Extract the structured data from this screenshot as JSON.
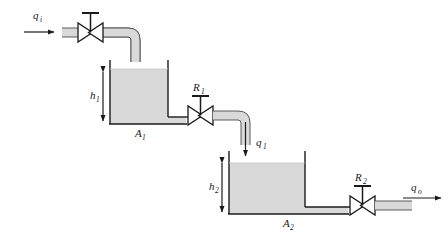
{
  "diagram": {
    "colors": {
      "line": "#1a1a1a",
      "fluid_fill": "#d9d9d9",
      "pipe_fill": "#d9d9d9",
      "background": "#ffffff"
    },
    "labels": {
      "inlet_flow": "q",
      "inlet_flow_sub": "i",
      "valve_1": "R",
      "valve_1_sub": "1",
      "valve_2": "R",
      "valve_2_sub": "2",
      "height_1": "h",
      "height_1_sub": "1",
      "height_2": "h",
      "height_2_sub": "2",
      "area_1": "A",
      "area_1_sub": "1",
      "area_2": "A",
      "area_2_sub": "2",
      "intermediate_flow": "q",
      "intermediate_flow_sub": "1",
      "outlet_flow": "q",
      "outlet_flow_sub": "o"
    },
    "components": [
      {
        "name": "inlet-arrow",
        "label": "qi",
        "type": "flow-arrow",
        "direction": "right"
      },
      {
        "name": "inlet-valve",
        "label": "",
        "type": "valve"
      },
      {
        "name": "inlet-pipe",
        "label": "",
        "type": "pipe"
      },
      {
        "name": "tank-1",
        "label": "A1",
        "type": "tank",
        "height_label": "h1"
      },
      {
        "name": "valve-r1",
        "label": "R1",
        "type": "valve"
      },
      {
        "name": "intermediate-pipe",
        "label": "",
        "type": "pipe"
      },
      {
        "name": "intermediate-arrow",
        "label": "q1",
        "type": "flow-arrow",
        "direction": "down"
      },
      {
        "name": "tank-2",
        "label": "A2",
        "type": "tank",
        "height_label": "h2"
      },
      {
        "name": "valve-r2",
        "label": "R2",
        "type": "valve"
      },
      {
        "name": "outlet-pipe",
        "label": "",
        "type": "pipe"
      },
      {
        "name": "outlet-arrow",
        "label": "qo",
        "type": "flow-arrow",
        "direction": "right"
      }
    ]
  }
}
